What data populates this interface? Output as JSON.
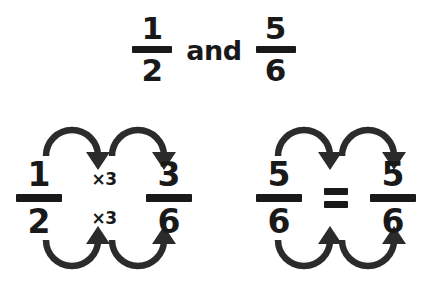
{
  "title": {
    "left_fraction": {
      "numerator": "1",
      "denominator": "2"
    },
    "conjunction": "and",
    "right_fraction": {
      "numerator": "5",
      "denominator": "6"
    }
  },
  "diagrams": [
    {
      "name": "half-to-three-sixths",
      "source_fraction": {
        "numerator": "1",
        "denominator": "2"
      },
      "relation": "",
      "result_fraction": {
        "numerator": "3",
        "denominator": "6"
      },
      "numerator_operation": "×3",
      "denominator_operation": "×3",
      "arrows": {
        "top_label": "numerator-arrows",
        "bottom_label": "denominator-arrows",
        "count": 2
      }
    },
    {
      "name": "five-sixths-equals-five-sixths",
      "source_fraction": {
        "numerator": "5",
        "denominator": "6"
      },
      "relation": "=",
      "result_fraction": {
        "numerator": "5",
        "denominator": "6"
      },
      "numerator_operation": "",
      "denominator_operation": "",
      "arrows": {
        "top_label": "numerator-arrows",
        "bottom_label": "denominator-arrows",
        "count": 2
      }
    }
  ],
  "colors": {
    "background": "#ffffff",
    "ink": "#191919",
    "arrow": "#2b2b2b"
  }
}
